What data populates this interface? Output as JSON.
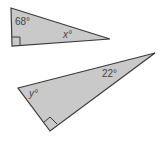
{
  "diagram": {
    "fill_color": "#c9c9c9",
    "stroke_color": "#3a3a3a",
    "triangles": [
      {
        "name": "triangle-1",
        "points": "11,8 12,46 110,39",
        "right_angle_mark": "12,37 20,37 20,45",
        "angles": [
          {
            "label": "68°",
            "x": 15,
            "y": 25,
            "italic": false
          },
          {
            "label": "x°",
            "x": 63,
            "y": 38,
            "italic": true
          }
        ]
      },
      {
        "name": "triangle-2",
        "points": "18,88 155,53 50,131",
        "right_angle_mark": "43,123 50,117 57,124",
        "angles": [
          {
            "label": "22°",
            "x": 102,
            "y": 77,
            "italic": false
          },
          {
            "label": "y°",
            "x": 29,
            "y": 97,
            "italic": true
          }
        ]
      }
    ]
  }
}
